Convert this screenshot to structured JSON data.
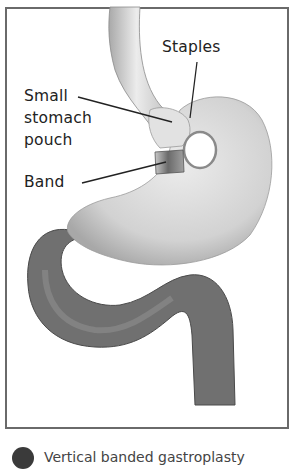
{
  "figure": {
    "labels": {
      "staples": "Staples",
      "pouch_line1": "Small",
      "pouch_line2": "stomach",
      "pouch_line3": "pouch",
      "band": "Band"
    },
    "footer": {
      "icon": "numbered-badge-icon",
      "text": "Vertical banded gastroplasty"
    },
    "colors": {
      "frame": "#6a6a6a",
      "stomach": "#d4d4d4",
      "intestine": "#6e6e6e",
      "band": "#9a9a9a",
      "leader_lines": "#222222"
    }
  }
}
